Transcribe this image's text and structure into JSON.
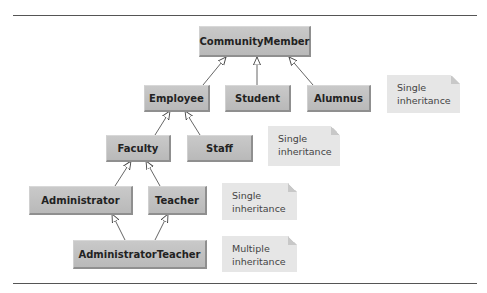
{
  "diagram": {
    "type": "uml-class-hierarchy",
    "classes": {
      "community_member": "CommunityMember",
      "employee": "Employee",
      "student": "Student",
      "alumnus": "Alumnus",
      "faculty": "Faculty",
      "staff": "Staff",
      "administrator": "Administrator",
      "teacher": "Teacher",
      "administrator_teacher": "AdministratorTeacher"
    },
    "notes": {
      "note1": {
        "line1": "Single",
        "line2": "inheritance"
      },
      "note2": {
        "line1": "Single",
        "line2": "inheritance"
      },
      "note3": {
        "line1": "Single",
        "line2": "inheritance"
      },
      "note4": {
        "line1": "Multiple",
        "line2": "inheritance"
      }
    },
    "edges": [
      {
        "from": "Employee",
        "to": "CommunityMember"
      },
      {
        "from": "Student",
        "to": "CommunityMember"
      },
      {
        "from": "Alumnus",
        "to": "CommunityMember"
      },
      {
        "from": "Faculty",
        "to": "Employee"
      },
      {
        "from": "Staff",
        "to": "Employee"
      },
      {
        "from": "Administrator",
        "to": "Faculty"
      },
      {
        "from": "Teacher",
        "to": "Faculty"
      },
      {
        "from": "AdministratorTeacher",
        "to": "Administrator"
      },
      {
        "from": "AdministratorTeacher",
        "to": "Teacher"
      }
    ],
    "colors": {
      "class_fill": "#c2c2c2",
      "note_fill": "#e6e6e6",
      "line": "#555555"
    }
  }
}
